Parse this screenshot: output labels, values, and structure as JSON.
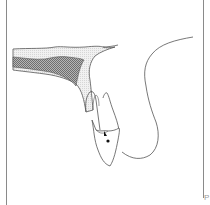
{
  "figure": {
    "label": "P",
    "colors": {
      "outline": "#555555",
      "cortical_bone": "#e6e6e6",
      "cancellous_bone": "#8c8c8c",
      "frame": "#8a8a8a",
      "background": "#ffffff"
    },
    "markers": [
      "arrow-marker",
      "dot-marker"
    ]
  }
}
